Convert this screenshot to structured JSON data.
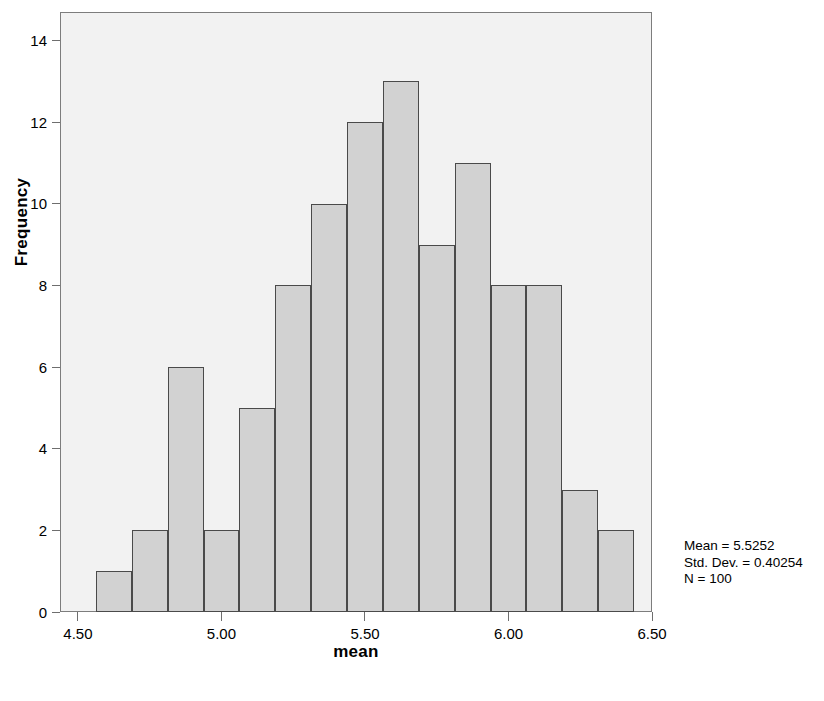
{
  "chart_data": {
    "type": "bar",
    "title": "",
    "subtitle": "",
    "xlabel": "mean",
    "ylabel": "Frequency",
    "xlim": [
      4.4375,
      6.5
    ],
    "ylim": [
      0,
      14.7
    ],
    "grid": false,
    "legend": "none",
    "bin_width": 0.125,
    "bin_starts": [
      4.5625,
      4.6875,
      4.8125,
      4.9375,
      5.0625,
      5.1875,
      5.3125,
      5.4375,
      5.5625,
      5.6875,
      5.8125,
      5.9375,
      6.0625,
      6.1875,
      6.3125
    ],
    "categories": [
      "4.56-4.69",
      "4.69-4.81",
      "4.81-4.94",
      "4.94-5.06",
      "5.06-5.19",
      "5.19-5.31",
      "5.31-5.44",
      "5.44-5.56",
      "5.56-5.69",
      "5.69-5.81",
      "5.81-5.94",
      "5.94-6.06",
      "6.06-6.19",
      "6.19-6.31",
      "6.31-6.44"
    ],
    "values": [
      1,
      2,
      6,
      2,
      5,
      8,
      10,
      12,
      13,
      9,
      11,
      8,
      8,
      3,
      2
    ],
    "xticks": [
      4.5,
      5.0,
      5.5,
      6.0,
      6.5
    ],
    "xticklabels": [
      "4.50",
      "5.00",
      "5.50",
      "6.00",
      "6.50"
    ],
    "yticks": [
      0,
      2,
      4,
      6,
      8,
      10,
      12,
      14
    ],
    "yticklabels": [
      "0",
      "2",
      "4",
      "6",
      "8",
      "10",
      "12",
      "14"
    ],
    "annotations": [
      "Mean = 5.5252",
      "Std. Dev. = 0.40254",
      "N = 100"
    ],
    "colors": {
      "bar_fill": "#d2d2d2",
      "bar_border": "#4a4a4a",
      "plot_background": "#f2f2f2",
      "frame_border": "#7d7d7d",
      "text": "#000000",
      "page_background": "#ffffff"
    }
  },
  "stats": {
    "mean_label": "Mean = 5.5252",
    "std_dev_label": "Std. Dev. = 0.40254",
    "n_label": "N = 100"
  },
  "axes": {
    "x_title": "mean",
    "y_title": "Frequency"
  }
}
